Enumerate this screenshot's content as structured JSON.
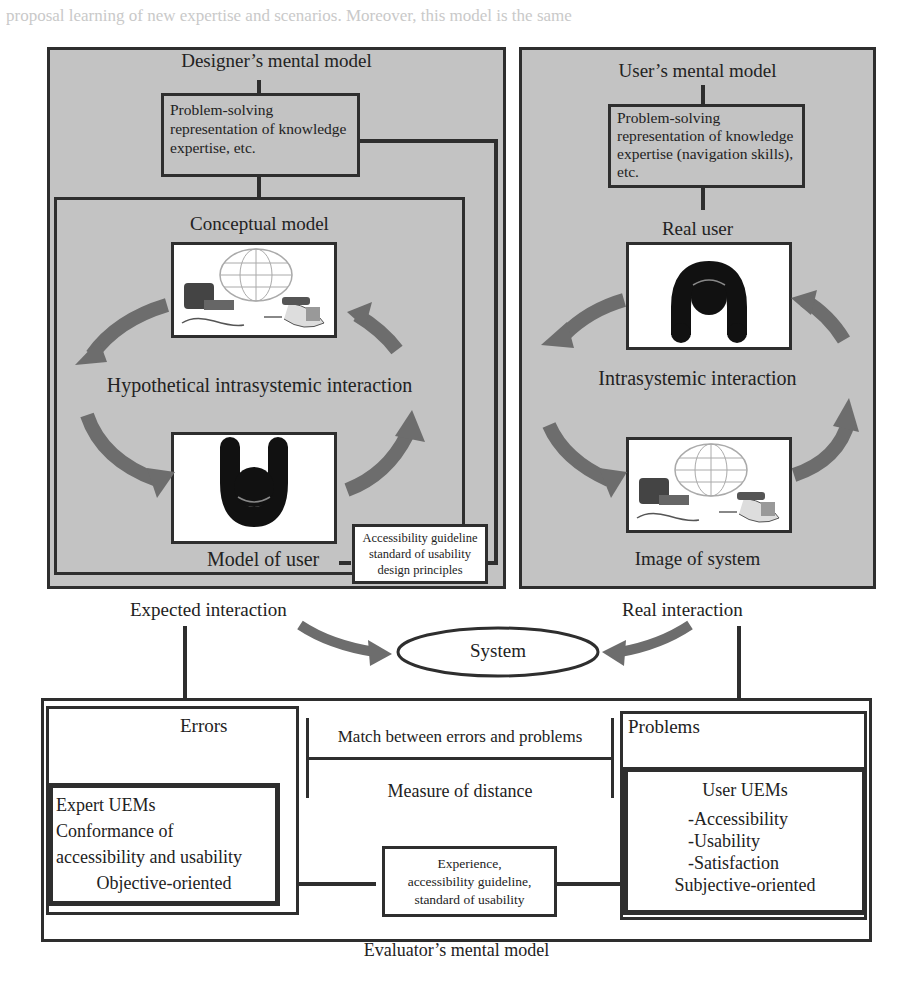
{
  "page_background_text": "proposal learning of new expertise and scenarios. Moreover, this model is the same",
  "designer_panel": {
    "title": "Designer’s mental model",
    "knowledge_box": [
      "Problem-solving",
      "representation of knowledge",
      "expertise, etc."
    ],
    "conceptual_model": {
      "title": "Conceptual model",
      "system_image_icon": "computer-globe-phone-icon",
      "cycle_label": "Hypothetical intrasystemic interaction",
      "user_icon": "user-figure-icon",
      "model_of_user_label": "Model of user"
    },
    "guideline_box": [
      "Accessibility guideline",
      "standard of usability",
      "design principles"
    ]
  },
  "user_panel": {
    "title": "User’s mental model",
    "knowledge_box": [
      "Problem-solving",
      "representation of knowledge",
      "expertise (navigation skills),",
      "etc."
    ],
    "real_user_label": "Real user",
    "user_icon": "user-figure-icon",
    "cycle_label": "Intrasystemic interaction",
    "system_image_icon": "computer-globe-phone-icon",
    "image_of_system_label": "Image of system"
  },
  "middle": {
    "expected_interaction": "Expected interaction",
    "real_interaction": "Real interaction",
    "system": "System"
  },
  "evaluator_panel": {
    "errors_label": "Errors",
    "expert_uems": [
      "Expert UEMs",
      "Conformance of",
      "accessibility and usability"
    ],
    "objective_oriented": "Objective-oriented",
    "match_label": "Match between errors and problems",
    "measure_label": "Measure of distance",
    "experience_box": [
      "Experience,",
      "accessibility guideline,",
      "standard of usability"
    ],
    "problems_label": "Problems",
    "user_uems_title": "User UEMs",
    "user_uems_items": [
      "-Accessibility",
      "-Usability",
      "-Satisfaction"
    ],
    "subjective_oriented": "Subjective-oriented",
    "title": "Evaluator’s mental model"
  },
  "colors": {
    "panel_gray": "#c3c3c3",
    "border": "#2e2e2e",
    "arrow_gray": "#6d6d6d",
    "white": "#ffffff"
  }
}
